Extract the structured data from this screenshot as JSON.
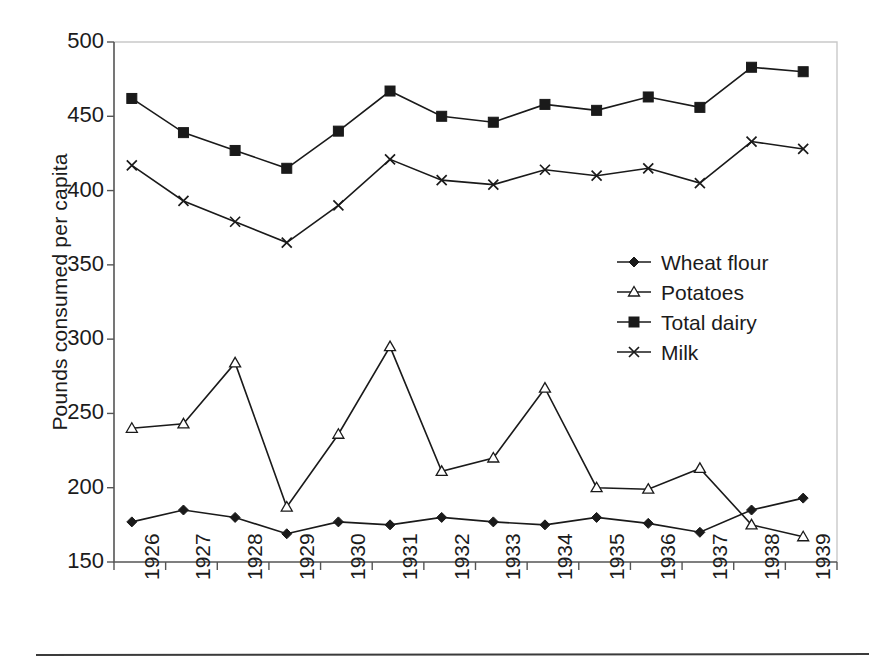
{
  "chart_data": {
    "type": "line",
    "title": "",
    "xlabel": "",
    "ylabel": "Pounds consumed per capita",
    "categories": [
      "1926",
      "1927",
      "1928",
      "1929",
      "1930",
      "1931",
      "1932",
      "1933",
      "1934",
      "1935",
      "1936",
      "1937",
      "1938",
      "1939"
    ],
    "ylim": [
      150,
      500
    ],
    "yticks": [
      150,
      200,
      250,
      300,
      350,
      400,
      450,
      500
    ],
    "grid": false,
    "legend_position": "center-right",
    "series": [
      {
        "name": "Wheat flour",
        "marker": "filled-diamond",
        "values": [
          177,
          185,
          180,
          169,
          177,
          175,
          180,
          177,
          175,
          180,
          176,
          170,
          185,
          193
        ]
      },
      {
        "name": "Potatoes",
        "marker": "open-triangle",
        "values": [
          240,
          243,
          284,
          187,
          236,
          295,
          211,
          220,
          267,
          200,
          199,
          213,
          175,
          167
        ]
      },
      {
        "name": "Total dairy",
        "marker": "filled-square",
        "values": [
          462,
          439,
          427,
          415,
          440,
          467,
          450,
          446,
          458,
          454,
          463,
          456,
          483,
          480
        ]
      },
      {
        "name": "Milk",
        "marker": "x-cross",
        "values": [
          417,
          393,
          379,
          365,
          390,
          421,
          407,
          404,
          414,
          410,
          415,
          405,
          433,
          428
        ]
      }
    ]
  },
  "legend": {
    "items": [
      {
        "label": "Wheat flour",
        "marker": "filled-diamond"
      },
      {
        "label": "Potatoes",
        "marker": "open-triangle"
      },
      {
        "label": "Total dairy",
        "marker": "filled-square"
      },
      {
        "label": "Milk",
        "marker": "x-cross"
      }
    ]
  },
  "colors": {
    "ink": "#1a1a1a",
    "axis": "#555555",
    "frame_light": "#c9c9c9",
    "background": "#ffffff"
  }
}
